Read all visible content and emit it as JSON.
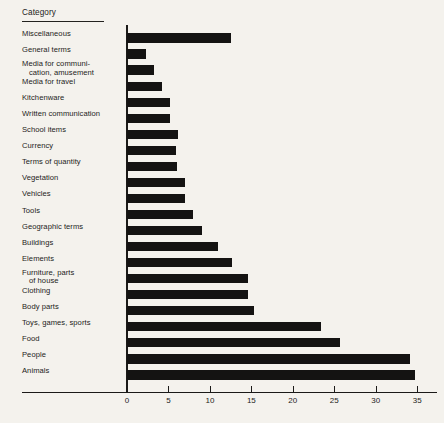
{
  "header": {
    "column_title": "Category"
  },
  "axis": {
    "tick_labels": [
      "0",
      "5",
      "10",
      "15",
      "20",
      "25",
      "30",
      "35"
    ]
  },
  "chart_data": {
    "type": "bar",
    "orientation": "horizontal",
    "title": "",
    "xlabel": "",
    "ylabel": "Category",
    "xlim": [
      0,
      37
    ],
    "grid": false,
    "legend": null,
    "bar_color": "#141312",
    "background_color": "#f4f2ed",
    "categories": [
      "Miscellaneous",
      "General terms",
      "Media for communi- cation, amusement",
      "Media for travel",
      "Kitchenware",
      "Written communication",
      "School items",
      "Currency",
      "Terms of quantity",
      "Vegetation",
      "Vehicles",
      "Tools",
      "Geographic terms",
      "Buildings",
      "Elements",
      "Furniture, parts of house",
      "Clothing",
      "Body parts",
      "Toys, games, sports",
      "Food",
      "People",
      "Animals"
    ],
    "values": [
      12.5,
      2.3,
      3.2,
      4.2,
      5.2,
      5.2,
      6.2,
      5.9,
      6.0,
      7.0,
      7.0,
      8.0,
      9.0,
      11.0,
      12.7,
      14.6,
      14.6,
      15.3,
      23.4,
      25.7,
      34.1,
      34.8
    ],
    "rows": [
      {
        "label_line1": "Miscellaneous",
        "label_line2": "",
        "value": 12.5
      },
      {
        "label_line1": "General terms",
        "label_line2": "",
        "value": 2.3
      },
      {
        "label_line1": "Media for communi-",
        "label_line2": "cation, amusement",
        "value": 3.2
      },
      {
        "label_line1": "Media for travel",
        "label_line2": "",
        "value": 4.2
      },
      {
        "label_line1": "Kitchenware",
        "label_line2": "",
        "value": 5.2
      },
      {
        "label_line1": "Written communication",
        "label_line2": "",
        "value": 5.2
      },
      {
        "label_line1": "School items",
        "label_line2": "",
        "value": 6.2
      },
      {
        "label_line1": "Currency",
        "label_line2": "",
        "value": 5.9
      },
      {
        "label_line1": "Terms of quantity",
        "label_line2": "",
        "value": 6.0
      },
      {
        "label_line1": "Vegetation",
        "label_line2": "",
        "value": 7.0
      },
      {
        "label_line1": "Vehicles",
        "label_line2": "",
        "value": 7.0
      },
      {
        "label_line1": "Tools",
        "label_line2": "",
        "value": 8.0
      },
      {
        "label_line1": "Geographic terms",
        "label_line2": "",
        "value": 9.0
      },
      {
        "label_line1": "Buildings",
        "label_line2": "",
        "value": 11.0
      },
      {
        "label_line1": "Elements",
        "label_line2": "",
        "value": 12.7
      },
      {
        "label_line1": "Furniture, parts",
        "label_line2": "of house",
        "value": 14.6
      },
      {
        "label_line1": "Clothing",
        "label_line2": "",
        "value": 14.6
      },
      {
        "label_line1": "Body parts",
        "label_line2": "",
        "value": 15.3
      },
      {
        "label_line1": "Toys, games, sports",
        "label_line2": "",
        "value": 23.4
      },
      {
        "label_line1": "Food",
        "label_line2": "",
        "value": 25.7
      },
      {
        "label_line1": "People",
        "label_line2": "",
        "value": 34.1
      },
      {
        "label_line1": "Animals",
        "label_line2": "",
        "value": 34.8
      }
    ]
  }
}
